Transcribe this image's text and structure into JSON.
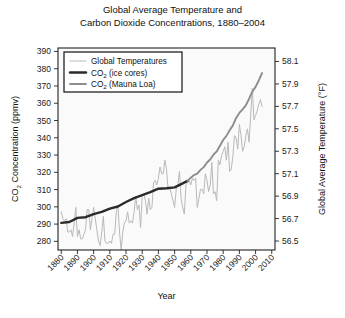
{
  "chart_data": {
    "type": "line",
    "title": "Global Average Temperature and Carbon Dioxide Concentrations, 1880–2004",
    "title_line1": "Global Average Temperature and",
    "title_line2": "Carbon Dioxide Concentrations, 1880–2004",
    "xlabel": "Year",
    "ylabel": "CO2 Concentration (ppmv)",
    "ylabel_prefix": "CO",
    "ylabel_sub": "2",
    "ylabel_suffix": " Concentration (ppmv)",
    "y2label": "Global Average Temperature (°F)",
    "grid": false,
    "legend_position": "top-left-inside",
    "xlim": [
      1878,
      2012
    ],
    "xticks": [
      1880,
      1890,
      1900,
      1910,
      1920,
      1930,
      1940,
      1950,
      1960,
      1970,
      1980,
      1990,
      2000,
      2010
    ],
    "xticklabels": [
      "1880",
      "1890",
      "1900",
      "1910",
      "1920",
      "1930",
      "1940",
      "1950",
      "1960",
      "1970",
      "1980",
      "1990",
      "2000",
      "2010"
    ],
    "ylim": [
      275,
      392
    ],
    "yticks": [
      280,
      290,
      300,
      310,
      320,
      330,
      340,
      350,
      360,
      370,
      380,
      390
    ],
    "yticklabels": [
      "280",
      "290",
      "300",
      "310",
      "320",
      "330",
      "340",
      "350",
      "360",
      "370",
      "380",
      "390"
    ],
    "y2lim": [
      56.42,
      58.22
    ],
    "y2ticks": [
      56.5,
      56.7,
      56.9,
      57.1,
      57.3,
      57.5,
      57.7,
      57.9,
      58.1
    ],
    "y2ticklabels": [
      "56.5",
      "56.7",
      "56.9",
      "57.1",
      "57.3",
      "57.5",
      "57.7",
      "57.9",
      "58.1"
    ],
    "legend": [
      {
        "name": "Global Temperatures",
        "color": "#b9b9b9",
        "width": 1.0,
        "axis": "right"
      },
      {
        "name": "CO2 (ice cores)",
        "name_prefix": "CO",
        "name_sub": "2",
        "name_suffix": " (ice cores)",
        "color": "#2b2b2b",
        "width": 2.4,
        "axis": "left"
      },
      {
        "name": "CO2 (Mauna Loa)",
        "name_prefix": "CO",
        "name_sub": "2",
        "name_suffix": " (Mauna Loa)",
        "color": "#8d8d8d",
        "width": 1.9,
        "axis": "left"
      }
    ],
    "series": [
      {
        "name": "Global Temperatures",
        "axis": "right",
        "units": "°F",
        "x": [
          1880,
          1881,
          1882,
          1883,
          1884,
          1885,
          1886,
          1887,
          1888,
          1889,
          1890,
          1891,
          1892,
          1893,
          1894,
          1895,
          1896,
          1897,
          1898,
          1899,
          1900,
          1901,
          1902,
          1903,
          1904,
          1905,
          1906,
          1907,
          1908,
          1909,
          1910,
          1911,
          1912,
          1913,
          1914,
          1915,
          1916,
          1917,
          1918,
          1919,
          1920,
          1921,
          1922,
          1923,
          1924,
          1925,
          1926,
          1927,
          1928,
          1929,
          1930,
          1931,
          1932,
          1933,
          1934,
          1935,
          1936,
          1937,
          1938,
          1939,
          1940,
          1941,
          1942,
          1943,
          1944,
          1945,
          1946,
          1947,
          1948,
          1949,
          1950,
          1951,
          1952,
          1953,
          1954,
          1955,
          1956,
          1957,
          1958,
          1959,
          1960,
          1961,
          1962,
          1963,
          1964,
          1965,
          1966,
          1967,
          1968,
          1969,
          1970,
          1971,
          1972,
          1973,
          1974,
          1975,
          1976,
          1977,
          1978,
          1979,
          1980,
          1981,
          1982,
          1983,
          1984,
          1985,
          1986,
          1987,
          1988,
          1989,
          1990,
          1991,
          1992,
          1993,
          1994,
          1995,
          1996,
          1997,
          1998,
          1999,
          2000,
          2001,
          2002,
          2003,
          2004
        ],
        "values": [
          56.76,
          56.7,
          56.68,
          56.7,
          56.58,
          56.58,
          56.6,
          56.54,
          56.66,
          56.8,
          56.54,
          56.6,
          56.52,
          56.52,
          56.56,
          56.6,
          56.78,
          56.78,
          56.6,
          56.7,
          56.8,
          56.7,
          56.6,
          56.5,
          56.46,
          56.58,
          56.72,
          56.5,
          56.48,
          56.48,
          56.5,
          56.48,
          56.56,
          56.56,
          56.76,
          56.82,
          56.58,
          56.42,
          56.58,
          56.66,
          56.68,
          56.76,
          56.66,
          56.68,
          56.66,
          56.76,
          56.9,
          56.78,
          56.82,
          56.62,
          56.9,
          56.92,
          56.86,
          56.74,
          56.88,
          56.78,
          56.8,
          57.02,
          57.04,
          57.0,
          57.06,
          57.16,
          57.1,
          57.1,
          57.22,
          57.14,
          56.96,
          56.98,
          56.92,
          56.86,
          56.8,
          56.96,
          57.0,
          57.12,
          56.88,
          56.8,
          56.74,
          57.0,
          57.02,
          57.04,
          57.0,
          57.06,
          57.04,
          57.06,
          56.8,
          56.88,
          56.96,
          56.96,
          56.92,
          57.1,
          57.04,
          56.94,
          57.0,
          57.2,
          56.92,
          56.94,
          56.86,
          57.22,
          57.18,
          57.26,
          57.3,
          57.34,
          57.22,
          57.38,
          57.12,
          57.14,
          57.26,
          57.44,
          57.42,
          57.32,
          57.54,
          57.44,
          57.3,
          57.34,
          57.44,
          57.5,
          57.38,
          57.62,
          57.86,
          57.58,
          57.62,
          57.66,
          57.72,
          57.76,
          57.7
        ]
      },
      {
        "name": "CO2 (ice cores)",
        "axis": "left",
        "units": "ppmv",
        "x": [
          1880,
          1885,
          1890,
          1895,
          1900,
          1905,
          1910,
          1915,
          1920,
          1925,
          1930,
          1935,
          1940,
          1945,
          1950,
          1955,
          1958
        ],
        "values": [
          290.7,
          291.2,
          293.6,
          294.0,
          295.8,
          297.1,
          299.0,
          300.2,
          302.8,
          305.0,
          306.8,
          308.5,
          310.5,
          310.8,
          311.3,
          313.6,
          315.0
        ]
      },
      {
        "name": "CO2 (Mauna Loa)",
        "axis": "left",
        "units": "ppmv",
        "x": [
          1958,
          1960,
          1962,
          1964,
          1966,
          1968,
          1970,
          1972,
          1974,
          1976,
          1978,
          1980,
          1982,
          1984,
          1986,
          1988,
          1990,
          1992,
          1994,
          1996,
          1998,
          2000,
          2002,
          2004
        ],
        "values": [
          315.0,
          316.9,
          318.4,
          319.2,
          321.4,
          323.0,
          325.7,
          327.4,
          330.2,
          332.1,
          335.4,
          338.7,
          341.1,
          344.4,
          347.2,
          351.5,
          354.4,
          356.4,
          358.8,
          362.6,
          366.7,
          369.5,
          373.2,
          377.5
        ]
      }
    ]
  }
}
